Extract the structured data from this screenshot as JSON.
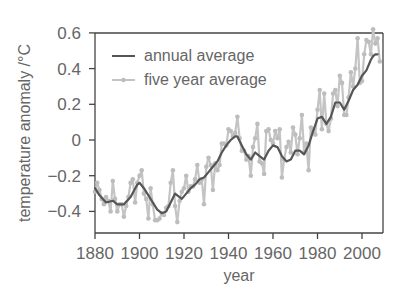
{
  "chart_data": {
    "type": "line",
    "title": "",
    "xlabel": "year",
    "ylabel": "temperature anomaly /°C",
    "xlim": [
      1880,
      2010
    ],
    "ylim": [
      -0.5,
      0.6
    ],
    "x_ticks": [
      1880,
      1900,
      1920,
      1940,
      1960,
      1980,
      2000
    ],
    "y_ticks": [
      0.6,
      0.4,
      0.2,
      0,
      -0.2,
      -0.4
    ],
    "y_tick_labels": [
      "0.6",
      "0.4",
      "0.2",
      "0",
      "−0.2",
      "−0.4"
    ],
    "grid": false,
    "legend_position": "upper left",
    "legend": [
      "annual average",
      "five year average"
    ],
    "colors": {
      "annual average": "#555555",
      "five year average": "#bdbdbd"
    },
    "series": [
      {
        "name": "annual average",
        "x": [
          1880,
          1882,
          1885,
          1888,
          1890,
          1893,
          1896,
          1899,
          1900,
          1902,
          1904,
          1906,
          1908,
          1910,
          1912,
          1914,
          1916,
          1917,
          1919,
          1921,
          1923,
          1925,
          1927,
          1929,
          1931,
          1933,
          1935,
          1937,
          1939,
          1941,
          1943,
          1944,
          1946,
          1948,
          1950,
          1952,
          1954,
          1956,
          1958,
          1960,
          1962,
          1964,
          1966,
          1968,
          1970,
          1972,
          1974,
          1976,
          1978,
          1980,
          1982,
          1984,
          1986,
          1988,
          1990,
          1992,
          1994,
          1996,
          1998,
          2000,
          2002,
          2004,
          2005,
          2006,
          2007
        ],
        "values": [
          -0.27,
          -0.31,
          -0.35,
          -0.34,
          -0.36,
          -0.36,
          -0.32,
          -0.25,
          -0.24,
          -0.27,
          -0.31,
          -0.35,
          -0.39,
          -0.41,
          -0.4,
          -0.35,
          -0.3,
          -0.31,
          -0.33,
          -0.3,
          -0.27,
          -0.25,
          -0.22,
          -0.21,
          -0.18,
          -0.15,
          -0.12,
          -0.07,
          -0.03,
          0.0,
          0.02,
          0.02,
          -0.03,
          -0.08,
          -0.11,
          -0.07,
          -0.09,
          -0.11,
          -0.06,
          -0.03,
          -0.04,
          -0.09,
          -0.12,
          -0.11,
          -0.06,
          -0.06,
          -0.08,
          -0.03,
          0.05,
          0.12,
          0.13,
          0.09,
          0.13,
          0.21,
          0.21,
          0.17,
          0.22,
          0.28,
          0.31,
          0.36,
          0.39,
          0.45,
          0.47,
          0.48,
          0.48
        ]
      },
      {
        "name": "five year average",
        "x": [
          1880,
          1881,
          1882,
          1883,
          1884,
          1885,
          1886,
          1887,
          1888,
          1889,
          1890,
          1891,
          1892,
          1893,
          1894,
          1895,
          1896,
          1897,
          1898,
          1899,
          1900,
          1901,
          1902,
          1903,
          1904,
          1905,
          1906,
          1907,
          1908,
          1909,
          1910,
          1911,
          1912,
          1913,
          1914,
          1915,
          1916,
          1917,
          1918,
          1919,
          1920,
          1921,
          1922,
          1923,
          1924,
          1925,
          1926,
          1927,
          1928,
          1929,
          1930,
          1931,
          1932,
          1933,
          1934,
          1935,
          1936,
          1937,
          1938,
          1939,
          1940,
          1941,
          1942,
          1943,
          1944,
          1945,
          1946,
          1947,
          1948,
          1949,
          1950,
          1951,
          1952,
          1953,
          1954,
          1955,
          1956,
          1957,
          1958,
          1959,
          1960,
          1961,
          1962,
          1963,
          1964,
          1965,
          1966,
          1967,
          1968,
          1969,
          1970,
          1971,
          1972,
          1973,
          1974,
          1975,
          1976,
          1977,
          1978,
          1979,
          1980,
          1981,
          1982,
          1983,
          1984,
          1985,
          1986,
          1987,
          1988,
          1989,
          1990,
          1991,
          1992,
          1993,
          1994,
          1995,
          1996,
          1997,
          1998,
          1999,
          2000,
          2001,
          2002,
          2003,
          2004,
          2005,
          2006,
          2007,
          2008
        ],
        "values": [
          -0.29,
          -0.24,
          -0.28,
          -0.33,
          -0.36,
          -0.32,
          -0.34,
          -0.4,
          -0.23,
          -0.33,
          -0.4,
          -0.36,
          -0.36,
          -0.43,
          -0.37,
          -0.32,
          -0.24,
          -0.22,
          -0.35,
          -0.24,
          -0.2,
          -0.17,
          -0.3,
          -0.33,
          -0.44,
          -0.27,
          -0.36,
          -0.45,
          -0.45,
          -0.44,
          -0.41,
          -0.42,
          -0.38,
          -0.37,
          -0.24,
          -0.17,
          -0.37,
          -0.46,
          -0.34,
          -0.29,
          -0.27,
          -0.2,
          -0.29,
          -0.26,
          -0.26,
          -0.22,
          -0.14,
          -0.24,
          -0.22,
          -0.36,
          -0.15,
          -0.1,
          -0.14,
          -0.28,
          -0.13,
          -0.17,
          -0.14,
          -0.02,
          -0.02,
          -0.03,
          0.06,
          0.05,
          0.02,
          0.04,
          0.13,
          0.01,
          -0.06,
          -0.06,
          -0.11,
          -0.09,
          -0.2,
          -0.04,
          0.01,
          0.09,
          -0.12,
          -0.13,
          -0.19,
          0.05,
          0.06,
          0.0,
          -0.02,
          0.05,
          0.01,
          0.06,
          -0.21,
          -0.11,
          -0.04,
          -0.01,
          -0.07,
          0.07,
          0.03,
          -0.08,
          0.01,
          0.14,
          -0.07,
          -0.02,
          -0.17,
          0.07,
          0.05,
          0.03,
          0.17,
          0.28,
          0.06,
          0.26,
          0.09,
          0.05,
          0.12,
          0.26,
          0.28,
          0.19,
          0.36,
          0.32,
          0.14,
          0.14,
          0.24,
          0.38,
          0.3,
          0.4,
          0.57,
          0.32,
          0.33,
          0.48,
          0.56,
          0.55,
          0.48,
          0.62,
          0.54,
          0.57,
          0.44
        ]
      }
    ]
  },
  "axes": {
    "xlabel": "year",
    "ylabel": "temperature anomaly /°C",
    "x_tick_labels": [
      "1880",
      "1900",
      "1920",
      "1940",
      "1960",
      "1980",
      "2000"
    ],
    "y_tick_labels": [
      "0.6",
      "0.4",
      "0.2",
      "0",
      "−0.2",
      "−0.4"
    ]
  },
  "legend": {
    "items": [
      {
        "label": "annual average",
        "icon": "dark-line-icon"
      },
      {
        "label": "five year average",
        "icon": "light-dotted-line-icon"
      }
    ]
  }
}
